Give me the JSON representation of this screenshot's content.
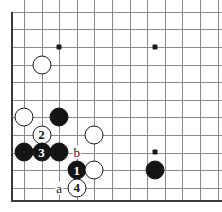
{
  "figure": {
    "board": {
      "origin_x": 24,
      "origin_y": 11.7,
      "spacing": 17.6,
      "cols": 12,
      "rows": 11,
      "left_edge_x": 11,
      "bottom_edge_y": 200,
      "line_color": "#8a8a8a",
      "edge_color": "#3a3a3a",
      "black_color": "#141414",
      "white_color": "#ffffff"
    },
    "hoshi_points": [
      {
        "name": "star-point-upper-left",
        "x": 59.2,
        "y": 47
      },
      {
        "name": "star-point-upper-right",
        "x": 154.8,
        "y": 47
      },
      {
        "name": "star-point-lower-right",
        "x": 154.8,
        "y": 152.4
      }
    ],
    "stones": [
      {
        "name": "white-stone-upper-left",
        "color": "white",
        "label": "",
        "x": 41.6,
        "y": 64.6,
        "d": 19
      },
      {
        "name": "white-stone-left-side",
        "color": "white",
        "label": "",
        "x": 24,
        "y": 117,
        "d": 19
      },
      {
        "name": "black-stone-upper-cluster",
        "color": "black",
        "label": "",
        "x": 59.2,
        "y": 117,
        "d": 19
      },
      {
        "name": "white-stone-move-2",
        "color": "white",
        "label": "2",
        "x": 41.6,
        "y": 134.6,
        "d": 19
      },
      {
        "name": "black-stone-left-edge",
        "color": "black",
        "label": "",
        "x": 24,
        "y": 152.4,
        "d": 19
      },
      {
        "name": "black-stone-move-3",
        "color": "black",
        "label": "3",
        "x": 41.6,
        "y": 152.4,
        "d": 19
      },
      {
        "name": "black-stone-center-cluster",
        "color": "black",
        "label": "",
        "x": 59.2,
        "y": 152.4,
        "d": 19
      },
      {
        "name": "white-stone-right-cluster",
        "color": "white",
        "label": "",
        "x": 94.4,
        "y": 134.6,
        "d": 19
      },
      {
        "name": "black-stone-move-1",
        "color": "black",
        "label": "1",
        "x": 76.8,
        "y": 170,
        "d": 19
      },
      {
        "name": "white-stone-lower-right-cluster",
        "color": "white",
        "label": "",
        "x": 94.4,
        "y": 170,
        "d": 19
      },
      {
        "name": "white-stone-move-4",
        "color": "white",
        "label": "4",
        "x": 76.8,
        "y": 187.6,
        "d": 19
      },
      {
        "name": "black-stone-lower-right",
        "color": "black",
        "label": "",
        "x": 154.8,
        "y": 170,
        "d": 19
      }
    ],
    "point_labels": [
      {
        "name": "point-label-b",
        "text": "b",
        "x": 76.8,
        "y": 152.4
      },
      {
        "name": "point-label-a",
        "text": "a",
        "x": 59.2,
        "y": 187.6
      }
    ]
  }
}
